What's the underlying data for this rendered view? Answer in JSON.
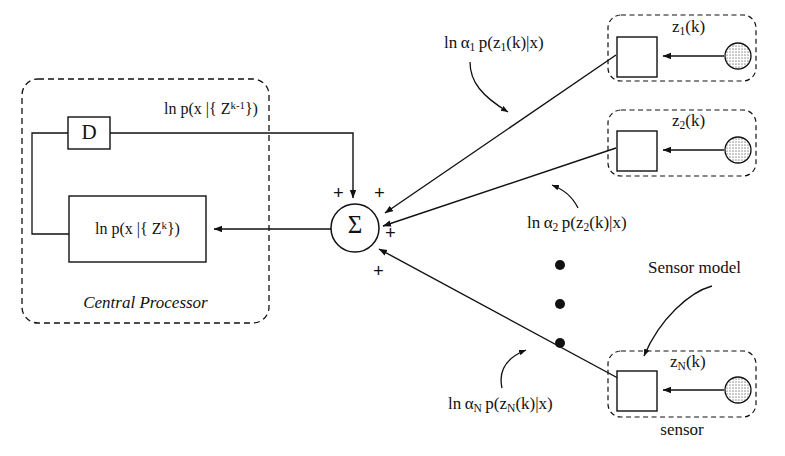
{
  "figure": {
    "type": "block-diagram",
    "title_fragment_top": "g",
    "central_processor": {
      "label": "Central Processor",
      "delay_block_label": "D",
      "delay_output_label_parts": {
        "prefix": "ln p(x  |{ Z",
        "sup": "k-1",
        "suffix": "})"
      },
      "state_block_label_parts": {
        "prefix": "ln p(x |{ Z",
        "sup": "k",
        "suffix": "})"
      },
      "summer_symbol": "Σ",
      "plus_signs": [
        "+",
        "+",
        "+",
        "+"
      ]
    },
    "sensors": [
      {
        "id": "sensor-1",
        "measurement_label_parts": {
          "base": "z",
          "sub": "1",
          "arg": "(k)"
        },
        "likelihood_label_parts": {
          "ln": "ln",
          "alpha": "α",
          "alpha_sub": "1",
          "body": "p(z",
          "body_sub": "1",
          "tail": "(k)|x)"
        }
      },
      {
        "id": "sensor-2",
        "measurement_label_parts": {
          "base": "z",
          "sub": "2",
          "arg": "(k)"
        },
        "likelihood_label_parts": {
          "ln": "ln",
          "alpha": "α",
          "alpha_sub": "2",
          "body": "p(z",
          "body_sub": "2",
          "tail": "(k)|x)"
        }
      },
      {
        "id": "sensor-N",
        "measurement_label_parts": {
          "base": "z",
          "sub": "N",
          "arg": "(k)"
        },
        "likelihood_label_parts": {
          "ln": "ln",
          "alpha": "α",
          "alpha_sub": "N",
          "body": "p(z",
          "body_sub": "N",
          "tail": "(k)|x)"
        }
      }
    ],
    "annotations": {
      "sensor_model": "Sensor model",
      "sensor": "sensor",
      "vertical_ellipsis": "•"
    },
    "colors": {
      "stroke": "#111111",
      "background": "#ffffff",
      "sensor_fill": "#d8d8d8",
      "dashed": "#111111"
    }
  }
}
